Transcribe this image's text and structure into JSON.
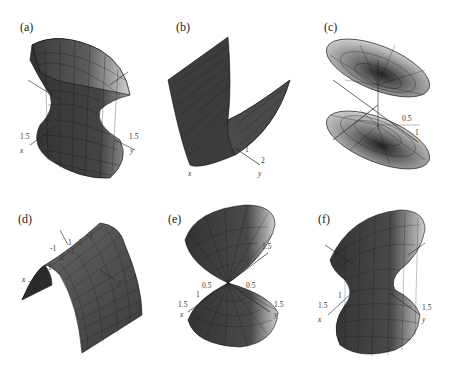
{
  "figure": {
    "panels": [
      {
        "id": "a",
        "label": "(a)",
        "surface": "hyperboloid-of-one-sheet",
        "ticks": {
          "x": "1.5",
          "y": "1.5"
        },
        "axes": {
          "x": "x",
          "y": "y"
        }
      },
      {
        "id": "b",
        "label": "(b)",
        "surface": "parabolic-cylinder-up",
        "ticks": {
          "y1": "1",
          "y2": "2"
        },
        "axes": {
          "x": "x",
          "y": "y"
        }
      },
      {
        "id": "c",
        "label": "(c)",
        "surface": "hyperboloid-of-two-sheets",
        "ticks": {
          "t1": "0.5",
          "t2": "1"
        },
        "axes": {}
      },
      {
        "id": "d",
        "label": "(d)",
        "surface": "parabolic-cylinder-down",
        "ticks": {
          "x3": "3",
          "x2": "2",
          "x1": "1",
          "x0": "0",
          "xm1": "-1",
          "y1": "1",
          "ym1": "-1",
          "ym2": "-2",
          "ym3": "-3"
        },
        "axes": {
          "x": "x",
          "y": "y"
        }
      },
      {
        "id": "e",
        "label": "(e)",
        "surface": "elliptic-cone",
        "ticks": {
          "x05": "0.5",
          "x1": "1",
          "x15": "1.5",
          "y05": "0.5",
          "y15": "1.5",
          "z15": "1.5"
        },
        "axes": {
          "x": "x",
          "y": "y"
        }
      },
      {
        "id": "f",
        "label": "(f)",
        "surface": "hyperboloid-of-one-sheet",
        "ticks": {
          "x1": "1",
          "x15": "1.5",
          "y15": "1.5"
        },
        "axes": {
          "x": "x",
          "y": "y"
        }
      }
    ],
    "colors": {
      "surface_dark": "#3a3a3a",
      "surface_mid": "#6e6e6e",
      "surface_light": "#d8d8d8",
      "grid": "#111111",
      "background": "#ffffff"
    }
  }
}
